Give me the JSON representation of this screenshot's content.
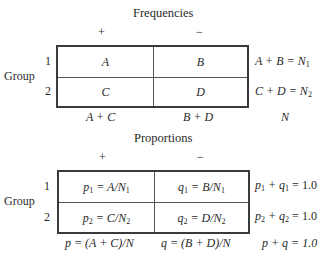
{
  "frequencies": {
    "title": "Frequencies",
    "col_headers": [
      "+",
      "−"
    ],
    "row_group_label": "Group",
    "row_labels": [
      "1",
      "2"
    ],
    "cells": [
      [
        "A",
        "B"
      ],
      [
        "C",
        "D"
      ]
    ],
    "row_totals": [
      {
        "expr": "A + B = N",
        "sub": "1"
      },
      {
        "expr": "C + D = N",
        "sub": "2"
      }
    ],
    "col_totals": [
      "A + C",
      "B + D"
    ],
    "grand_total": "N"
  },
  "proportions": {
    "title": "Proportions",
    "col_headers": [
      "+",
      "−"
    ],
    "row_group_label": "Group",
    "row_labels": [
      "1",
      "2"
    ],
    "cells": [
      [
        {
          "pre": "p",
          "presub": "1",
          "mid": " = A/N",
          "sub": "1"
        },
        {
          "pre": "q",
          "presub": "1",
          "mid": " = B/N",
          "sub": "1"
        }
      ],
      [
        {
          "pre": "p",
          "presub": "2",
          "mid": " = C/N",
          "sub": "2"
        },
        {
          "pre": "q",
          "presub": "2",
          "mid": " = D/N",
          "sub": "2"
        }
      ]
    ],
    "row_totals": [
      {
        "a": "p",
        "asub": "1",
        "b": " + q",
        "bsub": "1",
        "rest": " = 1.0"
      },
      {
        "a": "p",
        "asub": "2",
        "b": " + q",
        "bsub": "2",
        "rest": " = 1.0"
      }
    ],
    "col_totals": [
      "p = (A + C)/N",
      "q = (B + D)/N"
    ],
    "grand_total": "p + q = 1.0"
  }
}
